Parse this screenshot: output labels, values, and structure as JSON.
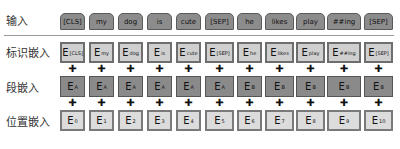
{
  "rows": {
    "input": "输入",
    "token": "标识嵌入",
    "segment": "段嵌入",
    "position": "位置嵌入"
  },
  "plus_symbol": "✚",
  "tokens": [
    "[CLS]",
    "my",
    "dog",
    "is",
    "cute",
    "[SEP]",
    "he",
    "likes",
    "play",
    "##ing",
    "[SEP]"
  ],
  "token_embeddings": [
    {
      "base": "E",
      "sub": "[CLS]"
    },
    {
      "base": "E",
      "sub": "my"
    },
    {
      "base": "E",
      "sub": "dog"
    },
    {
      "base": "E",
      "sub": "is"
    },
    {
      "base": "E",
      "sub": "cute"
    },
    {
      "base": "E",
      "sub": "[SEP]"
    },
    {
      "base": "E",
      "sub": "he"
    },
    {
      "base": "E",
      "sub": "likes"
    },
    {
      "base": "E",
      "sub": "play"
    },
    {
      "base": "E",
      "sub": "##ing"
    },
    {
      "base": "E",
      "sub": "[SEP]"
    }
  ],
  "segment_embeddings": [
    {
      "base": "E",
      "sub": "A"
    },
    {
      "base": "E",
      "sub": "A"
    },
    {
      "base": "E",
      "sub": "A"
    },
    {
      "base": "E",
      "sub": "A"
    },
    {
      "base": "E",
      "sub": "A"
    },
    {
      "base": "E",
      "sub": "A"
    },
    {
      "base": "E",
      "sub": "B"
    },
    {
      "base": "E",
      "sub": "B"
    },
    {
      "base": "E",
      "sub": "B"
    },
    {
      "base": "E",
      "sub": "B"
    },
    {
      "base": "E",
      "sub": "B"
    }
  ],
  "position_embeddings": [
    {
      "base": "E",
      "sub": "0"
    },
    {
      "base": "E",
      "sub": "1"
    },
    {
      "base": "E",
      "sub": "2"
    },
    {
      "base": "E",
      "sub": "3"
    },
    {
      "base": "E",
      "sub": "4"
    },
    {
      "base": "E",
      "sub": "5"
    },
    {
      "base": "E",
      "sub": "6"
    },
    {
      "base": "E",
      "sub": "7"
    },
    {
      "base": "E",
      "sub": "8"
    },
    {
      "base": "E",
      "sub": "9"
    },
    {
      "base": "E",
      "sub": "10"
    }
  ]
}
